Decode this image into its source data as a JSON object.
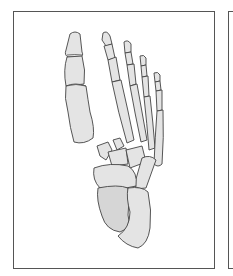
{
  "figure": {
    "colors": {
      "background": "#ffffff",
      "frame": "#555555",
      "bone_fill": "#e4e4e4",
      "bone_outline": "#444444"
    },
    "panels": [
      {
        "id": "main",
        "x": 13,
        "y": 11,
        "w": 202,
        "h": 258
      },
      {
        "id": "next",
        "x": 228,
        "y": 11,
        "w": 20,
        "h": 258
      }
    ]
  }
}
